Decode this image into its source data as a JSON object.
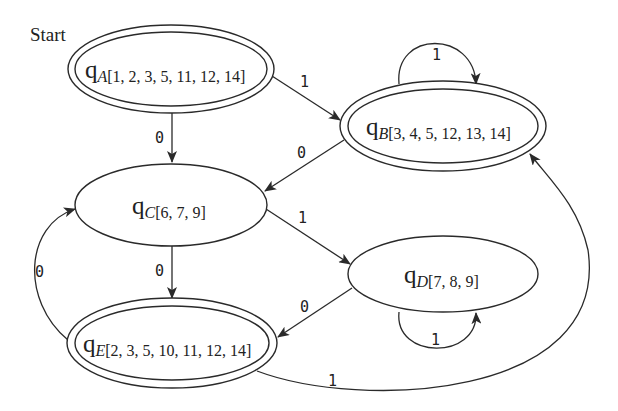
{
  "diagram": {
    "type": "DFA state transition diagram",
    "start_label": "Start",
    "states": [
      {
        "id": "A",
        "prefix": "q",
        "subscript_letter": "A",
        "subscript_set": "[1, 2, 3, 5, 11, 12, 14]",
        "accepting": true,
        "start": true
      },
      {
        "id": "B",
        "prefix": "q",
        "subscript_letter": "B",
        "subscript_set": "[3, 4, 5, 12, 13, 14]",
        "accepting": true,
        "start": false
      },
      {
        "id": "C",
        "prefix": "q",
        "subscript_letter": "C",
        "subscript_set": "[6, 7, 9]",
        "accepting": false,
        "start": false
      },
      {
        "id": "D",
        "prefix": "q",
        "subscript_letter": "D",
        "subscript_set": "[7, 8, 9]",
        "accepting": false,
        "start": false
      },
      {
        "id": "E",
        "prefix": "q",
        "subscript_letter": "E",
        "subscript_set": "[2, 3, 5, 10, 11, 12, 14]",
        "accepting": true,
        "start": false
      }
    ],
    "transitions": [
      {
        "from": "A",
        "to": "B",
        "label": "1"
      },
      {
        "from": "A",
        "to": "C",
        "label": "0"
      },
      {
        "from": "B",
        "to": "B",
        "label": "1"
      },
      {
        "from": "B",
        "to": "C",
        "label": "0"
      },
      {
        "from": "C",
        "to": "D",
        "label": "1"
      },
      {
        "from": "C",
        "to": "E",
        "label": "0"
      },
      {
        "from": "D",
        "to": "D",
        "label": "1"
      },
      {
        "from": "D",
        "to": "E",
        "label": "0"
      },
      {
        "from": "E",
        "to": "C",
        "label": "0"
      },
      {
        "from": "E",
        "to": "B",
        "label": "1"
      }
    ]
  }
}
